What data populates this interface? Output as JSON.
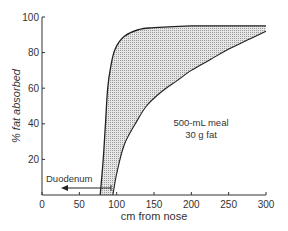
{
  "chart_data": {
    "type": "area",
    "title": "",
    "xlabel": "cm from nose",
    "ylabel": "% fat absorbed",
    "xlim": [
      0,
      300
    ],
    "ylim": [
      0,
      100
    ],
    "x_ticks": [
      "0",
      "50",
      "100",
      "150",
      "200",
      "250",
      "300"
    ],
    "y_ticks": [
      "20",
      "40",
      "60",
      "80",
      "100"
    ],
    "grid": false,
    "series": [
      {
        "name": "upper bound",
        "x": [
          78,
          82,
          85,
          88,
          92,
          98,
          110,
          130,
          150,
          200,
          250,
          300
        ],
        "y": [
          0,
          20,
          40,
          60,
          72,
          82,
          89,
          93,
          94,
          95,
          95,
          95
        ]
      },
      {
        "name": "lower bound",
        "x": [
          95,
          100,
          110,
          125,
          140,
          160,
          180,
          200,
          225,
          250,
          275,
          300
        ],
        "y": [
          0,
          12,
          28,
          40,
          50,
          58,
          64,
          70,
          76,
          82,
          87,
          92
        ]
      }
    ],
    "fill_between": true,
    "fill_color": "#cfcfcf",
    "annotations": [
      {
        "text": "500-mL meal",
        "x": 228,
        "y": 40
      },
      {
        "text": "30 g fat",
        "x": 228,
        "y": 33
      },
      {
        "text": "Duodenum",
        "x": 40,
        "y": 9,
        "arrow_from_x": 92,
        "arrow_to_x": 62,
        "arrow_y": 4
      }
    ]
  },
  "labels": {
    "xlabel": "cm from nose",
    "ylabel": "% fat absorbed",
    "meal_line1": "500-mL meal",
    "meal_line2": "30 g fat",
    "duodenum": "Duodenum",
    "x_ticks": [
      "0",
      "50",
      "100",
      "150",
      "200",
      "250",
      "300"
    ],
    "y_ticks": [
      "20",
      "40",
      "60",
      "80",
      "100"
    ]
  }
}
